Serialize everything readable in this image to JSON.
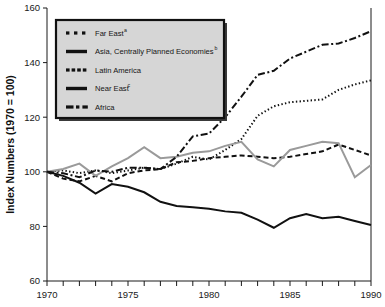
{
  "chart_data": {
    "type": "line",
    "title": "",
    "xlabel": "",
    "ylabel": "Index Numbers (1970 = 100)",
    "xlim": [
      1970,
      1990
    ],
    "ylim": [
      60,
      160
    ],
    "grid": false,
    "legend_position": "top-left",
    "x": [
      1970,
      1971,
      1972,
      1973,
      1974,
      1975,
      1976,
      1977,
      1978,
      1979,
      1980,
      1981,
      1982,
      1983,
      1984,
      1985,
      1986,
      1987,
      1988,
      1989,
      1990
    ],
    "xticks": [
      1970,
      1971,
      1972,
      1973,
      1974,
      1975,
      1976,
      1977,
      1978,
      1979,
      1980,
      1981,
      1982,
      1983,
      1984,
      1985,
      1986,
      1987,
      1988,
      1989,
      1990
    ],
    "xtick_labels": [
      "1970",
      "",
      "",
      "",
      "",
      "1975",
      "",
      "",
      "",
      "",
      "1980",
      "",
      "",
      "",
      "",
      "1985",
      "",
      "",
      "",
      "",
      "1990"
    ],
    "yticks": [
      60,
      80,
      100,
      120,
      140,
      160
    ],
    "ytick_labels": [
      "60",
      "80",
      "100",
      "120",
      "140",
      "160"
    ],
    "series": [
      {
        "name": "Far East",
        "note": "a",
        "style": "dotted",
        "color": "#111111",
        "values": [
          100,
          100.5,
          99.5,
          100.5,
          99.5,
          100.5,
          101.5,
          101,
          103,
          105.5,
          104.5,
          108,
          112,
          120.5,
          124,
          125.5,
          126,
          126.5,
          130,
          132,
          133.5
        ]
      },
      {
        "name": "Asia, Centrally Planned Economies",
        "note": "b",
        "style": "solid",
        "color": "#111111",
        "values": [
          100,
          98.5,
          96,
          92,
          95.5,
          94.5,
          92.5,
          89,
          87.5,
          87,
          86.5,
          85.5,
          85,
          82.5,
          79.5,
          83,
          84.5,
          83,
          83.5,
          82,
          80.5
        ]
      },
      {
        "name": "Latin America",
        "note": "",
        "style": "dashed",
        "color": "#111111",
        "values": [
          100,
          97.5,
          96.5,
          98.5,
          96.5,
          99.5,
          100.5,
          101,
          103.5,
          104,
          105,
          105.5,
          106,
          105.5,
          105,
          105.5,
          106.5,
          107.5,
          110,
          108,
          106
        ]
      },
      {
        "name": "Near East",
        "note": "c",
        "style": "solid",
        "color": "#9a9a9a",
        "values": [
          100,
          101,
          103,
          98.5,
          102,
          105,
          109,
          105,
          105.5,
          107,
          107.5,
          109.5,
          111,
          104.5,
          102,
          108,
          109.5,
          111,
          110.5,
          98,
          102.5
        ]
      },
      {
        "name": "Africa",
        "note": "",
        "style": "dashdot",
        "color": "#111111",
        "values": [
          100,
          99.5,
          98,
          100.5,
          100,
          101.5,
          101.5,
          101,
          105.5,
          113,
          114,
          120,
          127.5,
          135.5,
          137,
          141.5,
          144,
          146.5,
          147,
          149,
          151.5
        ]
      }
    ]
  },
  "legend": {
    "items": [
      {
        "label": "Far East",
        "sup": "a",
        "swatch": "dots-3"
      },
      {
        "label": "Asia, Centrally Planned Economies",
        "sup": "b",
        "swatch": "solid-bar"
      },
      {
        "label": "Latin America",
        "sup": "",
        "swatch": "dots-4"
      },
      {
        "label": "Near East",
        "sup": "c",
        "swatch": "solid-bar"
      },
      {
        "label": "Africa",
        "sup": "",
        "swatch": "dash-dot"
      }
    ]
  },
  "colors": {
    "axis": "#1a1a1a",
    "legend_fill": "#d6d6d6",
    "legend_border": "#111111",
    "near_east_line": "#9a9a9a",
    "default_line": "#111111"
  }
}
